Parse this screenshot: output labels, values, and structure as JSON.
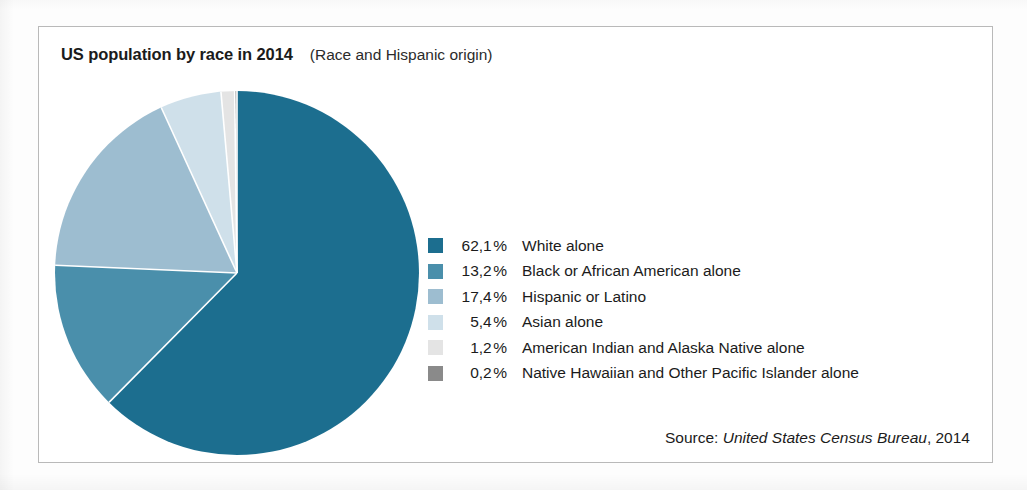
{
  "header": {
    "title": "US population by race in 2014",
    "subtitle": "(Race and Hispanic origin)"
  },
  "source": {
    "prefix": "Source:",
    "publisher": "United States Census Bureau",
    "year": ", 2014"
  },
  "chart_data": {
    "type": "pie",
    "title": "US population by race in 2014",
    "subtitle": "(Race and Hispanic origin)",
    "legend_position": "right",
    "start_angle_deg": 0,
    "direction": "clockwise",
    "total": 99.5,
    "value_suffix": "%",
    "decimal_separator": ",",
    "categories": [
      "White alone",
      "Black or African American alone",
      "Hispanic or Latino",
      "Asian alone",
      "American Indian and Alaska Native alone",
      "Native Hawaiian and Other Pacific Islander alone"
    ],
    "values": [
      62.1,
      13.2,
      17.4,
      5.4,
      1.2,
      0.2
    ],
    "value_labels": [
      "62,1",
      "13,2",
      "17,4",
      "5,4",
      "1,2",
      "0,2"
    ],
    "colors": [
      "#1c6e8f",
      "#4a8fab",
      "#9dbdd0",
      "#cfe0ea",
      "#e4e4e4",
      "#8a8a8a"
    ],
    "slices": [
      {
        "label": "White alone",
        "value_label": "62,1",
        "unit": "%",
        "value": 62.1,
        "color": "#1c6e8f"
      },
      {
        "label": "Black or African American alone",
        "value_label": "13,2",
        "unit": "%",
        "value": 13.2,
        "color": "#4a8fab"
      },
      {
        "label": "Hispanic or Latino",
        "value_label": "17,4",
        "unit": "%",
        "value": 17.4,
        "color": "#9dbdd0"
      },
      {
        "label": "Asian alone",
        "value_label": "5,4",
        "unit": "%",
        "value": 5.4,
        "color": "#cfe0ea"
      },
      {
        "label": "American Indian and Alaska Native alone",
        "value_label": "1,2",
        "unit": "%",
        "value": 1.2,
        "color": "#e4e4e4"
      },
      {
        "label": "Native Hawaiian and Other Pacific Islander alone",
        "value_label": "0,2",
        "unit": "%",
        "value": 0.2,
        "color": "#8a8a8a"
      }
    ]
  }
}
